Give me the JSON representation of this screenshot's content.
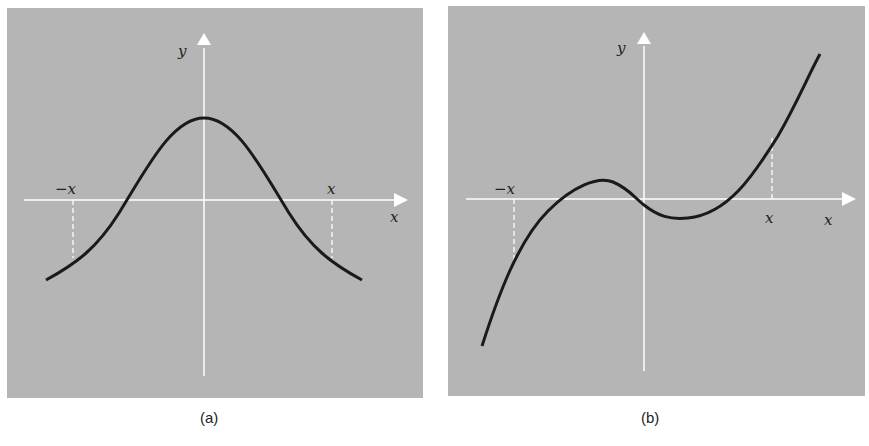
{
  "figure": {
    "panels": [
      {
        "id": "a",
        "caption": "(a)",
        "y_axis_label": "y",
        "x_axis_label": "x",
        "neg_x_label": "−x",
        "pos_x_label": "x",
        "curve": "even function (bell-shaped)"
      },
      {
        "id": "b",
        "caption": "(b)",
        "y_axis_label": "y",
        "x_axis_label": "x",
        "neg_x_label": "−x",
        "pos_x_label": "x",
        "curve": "odd-like cubic"
      }
    ],
    "colors": {
      "panel_bg": "#b5b5b5",
      "axis": "#ffffff",
      "curve": "#1a1a1a",
      "page_bg": "#ffffff"
    }
  }
}
